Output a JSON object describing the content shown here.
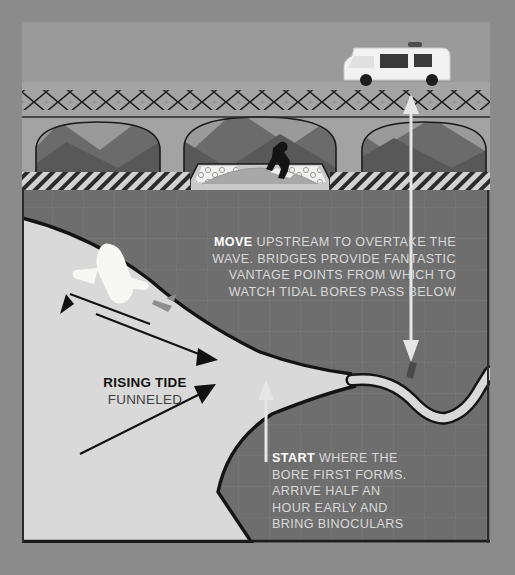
{
  "canvas": {
    "width": 515,
    "height": 575,
    "background": "#8b8b8b"
  },
  "palette": {
    "background": "#8b8b8b",
    "land": "#6e6e6e",
    "water": "#d9d9d9",
    "sky": "#9a9a9a",
    "hills_dark": "#5a5a5a",
    "hills_mid": "#6b6b6b",
    "bridge": "#a0a0a0",
    "beach_light": "#d2d2d2",
    "ink": "#111111",
    "text_light": "#d9d9d9",
    "text_white": "#ffffff",
    "van_body": "#f2f2f2",
    "van_glass": "#3a3a3a",
    "surfer": "#141414",
    "board": "#f0f0f0",
    "boat": "#f5f5f2",
    "bird": "#8d8d8d"
  },
  "scene": {
    "title_hidden": true,
    "upper_section": {
      "name": "bridge-elevation-view",
      "vehicle": "camper-van",
      "railing_pattern": "diamond-lattice",
      "arch_count": 3,
      "hills_layers": 2,
      "rider": "surfer-on-tidal-bore",
      "riverbank_texture": "pebble-cobble",
      "foreground_texture": "diagonal-hatch"
    },
    "lower_section": {
      "name": "estuary-plan-view",
      "grid": true,
      "features": [
        "funnel-estuary",
        "winding-river",
        "boat",
        "seagull",
        "tide-arrows"
      ]
    }
  },
  "annotations": {
    "move": {
      "lead": "MOVE",
      "body": " UPSTREAM TO OVERTAKE THE WAVE. BRIDGES PROVIDE FANTASTIC VANTAGE POINTS FROM WHICH TO WATCH TIDAL BORES PASS BELOW"
    },
    "start": {
      "lead": "START",
      "body": " WHERE THE BORE FIRST FORMS.  ARRIVE HALF AN HOUR EARLY AND BRING BINOCULARS"
    },
    "rising_tide": {
      "line1": "RISING TIDE",
      "line2": "FUNNELED"
    }
  },
  "markers": {
    "start_pointer": {
      "name": "start-up-arrow",
      "direction": "up"
    },
    "move_pointer": {
      "name": "move-down-arrow",
      "direction": "down"
    },
    "tide_arrows": {
      "name": "rising-tide-arrows",
      "count": 3,
      "direction": "upstream-east"
    }
  }
}
